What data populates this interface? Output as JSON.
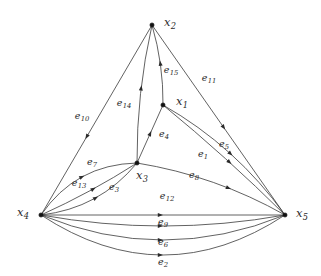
{
  "figure": {
    "type": "directed-multigraph-diagram",
    "width": 321,
    "height": 276,
    "background_color": "#ffffff",
    "edge_color": "#3a3a3a",
    "vertex_color": "#111111",
    "label_color": "#2b2b2b"
  },
  "vertices": [
    {
      "id": "x1",
      "name": "x",
      "index": "1",
      "label": "x1",
      "x": 163,
      "y": 105,
      "label_x": 182,
      "label_y": 102
    },
    {
      "id": "x2",
      "name": "x",
      "index": "2",
      "label": "x2",
      "x": 152,
      "y": 25,
      "label_x": 170,
      "label_y": 23
    },
    {
      "id": "x3",
      "name": "x",
      "index": "3",
      "label": "x3",
      "x": 137,
      "y": 163,
      "label_x": 142,
      "label_y": 176
    },
    {
      "id": "x4",
      "name": "x",
      "index": "4",
      "label": "x4",
      "x": 41,
      "y": 215,
      "label_x": 23,
      "label_y": 213
    },
    {
      "id": "x5",
      "name": "x",
      "index": "5",
      "label": "x5",
      "x": 285,
      "y": 215,
      "label_x": 302,
      "label_y": 214
    }
  ],
  "edges": [
    {
      "id": "e1",
      "name": "e",
      "index": "1",
      "label": "e1",
      "from": "x1",
      "to": "x5",
      "curve": -9,
      "label_x": 203,
      "label_y": 154,
      "arrow_t": 0.52
    },
    {
      "id": "e2",
      "name": "e",
      "index": "2",
      "label": "e2",
      "from": "x4",
      "to": "x5",
      "curve": 40,
      "label_x": 163,
      "label_y": 262,
      "arrow_t": 0.5
    },
    {
      "id": "e3",
      "name": "e",
      "index": "3",
      "label": "e3",
      "from": "x4",
      "to": "x3",
      "curve": 11,
      "label_x": 114,
      "label_y": 187,
      "arrow_t": 0.54
    },
    {
      "id": "e4",
      "name": "e",
      "index": "4",
      "label": "e4",
      "from": "x3",
      "to": "x1",
      "curve": 0,
      "label_x": 164,
      "label_y": 134,
      "arrow_t": 0.55
    },
    {
      "id": "e5",
      "name": "e",
      "index": "5",
      "label": "e5",
      "from": "x1",
      "to": "x5",
      "curve": -2,
      "label_x": 224,
      "label_y": 144,
      "arrow_t": 0.55
    },
    {
      "id": "e6",
      "name": "e",
      "index": "6",
      "label": "e6",
      "from": "x4",
      "to": "x5",
      "curve": 25,
      "label_x": 163,
      "label_y": 242,
      "arrow_t": 0.5
    },
    {
      "id": "e7",
      "name": "e",
      "index": "7",
      "label": "e7",
      "from": "x4",
      "to": "x3",
      "curve": -14,
      "label_x": 92,
      "label_y": 162,
      "arrow_t": 0.52
    },
    {
      "id": "e8",
      "name": "e",
      "index": "8",
      "label": "e8",
      "from": "x3",
      "to": "x5",
      "curve": -7,
      "label_x": 194,
      "label_y": 175,
      "arrow_t": 0.62
    },
    {
      "id": "e9",
      "name": "e",
      "index": "9",
      "label": "e9",
      "from": "x4",
      "to": "x5",
      "curve": 0,
      "label_x": 163,
      "label_y": 222,
      "arrow_t": 0.5
    },
    {
      "id": "e10",
      "name": "e",
      "index": "10",
      "label": "e10",
      "from": "x2",
      "to": "x4",
      "curve": 0,
      "label_x": 82,
      "label_y": 116,
      "arrow_t": 0.6
    },
    {
      "id": "e11",
      "name": "e",
      "index": "11",
      "label": "e11",
      "from": "x2",
      "to": "x5",
      "curve": 0,
      "label_x": 209,
      "label_y": 78,
      "arrow_t": 0.55
    },
    {
      "id": "e12",
      "name": "e",
      "index": "12",
      "label": "e12",
      "from": "x4",
      "to": "x5",
      "curve": 11,
      "label_x": 167,
      "label_y": 196,
      "arrow_t": 0.5
    },
    {
      "id": "e13",
      "name": "e",
      "index": "13",
      "label": "e13",
      "from": "x4",
      "to": "x3",
      "curve": 2,
      "label_x": 79,
      "label_y": 183,
      "arrow_t": 0.56
    },
    {
      "id": "e14",
      "name": "e",
      "index": "14",
      "label": "e14",
      "from": "x3",
      "to": "x2",
      "curve": -4,
      "label_x": 124,
      "label_y": 103,
      "arrow_t": 0.56
    },
    {
      "id": "e15",
      "name": "e",
      "index": "15",
      "label": "e15",
      "from": "x1",
      "to": "x2",
      "curve": 3,
      "label_x": 171,
      "label_y": 70,
      "arrow_t": 0.55
    }
  ]
}
